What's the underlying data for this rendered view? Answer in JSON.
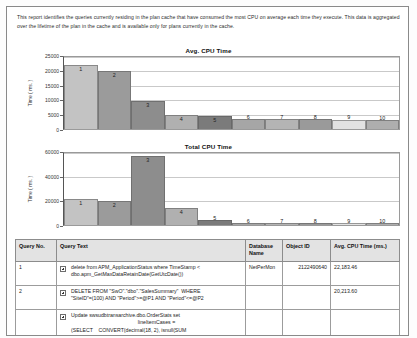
{
  "report": {
    "intro": "This report identifies the queries currently residing in the plan cache that have consumed the most CPU on average each time they execute.  This data is aggregated over the lifetime of the plan in the cache and is available only for plans currently in the cache."
  },
  "chart_data": [
    {
      "type": "bar",
      "title": "Avg. CPU Time",
      "xlabel": "",
      "ylabel": "Time ( ms. )",
      "categories": [
        "1",
        "2",
        "3",
        "4",
        "5",
        "6",
        "7",
        "8",
        "9",
        "10"
      ],
      "values": [
        22100,
        20200,
        9600,
        4900,
        4500,
        3400,
        3400,
        3350,
        3300,
        3250
      ],
      "ylim": [
        0,
        25000
      ],
      "yticks": [
        0,
        5000,
        10000,
        15000,
        20000,
        25000
      ],
      "grid": true,
      "legend": "none",
      "colors": [
        "#c3c3c3",
        "#9b9b9b",
        "#8d8d8d",
        "#b0b0b0",
        "#7b7b7b",
        "#a6a6a6",
        "#b4b4b4",
        "#9a9a9a",
        "#e2e2e2",
        "#aeaeae"
      ]
    },
    {
      "type": "bar",
      "title": "Total CPU Time",
      "xlabel": "",
      "ylabel": "Time ( ms. )",
      "categories": [
        "1",
        "2",
        "3",
        "4",
        "5",
        "6",
        "7",
        "8",
        "9",
        "10"
      ],
      "values": [
        21500,
        19800,
        57500,
        13800,
        4000,
        1600,
        1500,
        1700,
        1300,
        1400
      ],
      "ylim": [
        0,
        60000
      ],
      "yticks": [
        0,
        20000,
        40000,
        60000
      ],
      "grid": true,
      "legend": "none",
      "colors": [
        "#c3c3c3",
        "#9b9b9b",
        "#8d8d8d",
        "#b0b0b0",
        "#7b7b7b",
        "#a6a6a6",
        "#b4b4b4",
        "#9a9a9a",
        "#e2e2e2",
        "#aeaeae"
      ]
    }
  ],
  "table": {
    "headers": {
      "query_no": "Query No.",
      "query_text": "Query Text",
      "database_name": "Database Name",
      "object_id": "Object ID",
      "avg_cpu": "Avg. CPU Time (ms.)"
    },
    "rows": [
      {
        "no": "1",
        "text_lines": [
          "delete from APM_ApplicationStatus where TimeStamp <",
          "dbo.apm_GetMaxDataRetainDate(GetUtcDate())"
        ],
        "database_name": "NetPerMon",
        "object_id": "2122490640",
        "avg_cpu": "22,183.46"
      },
      {
        "no": "2",
        "text_lines": [
          "DELETE FROM \"SwO\".\"dbo\".\"SalesSummary\"  WHERE",
          "\"SiteID\"=(100) AND \"Period\">=@P1 AND \"Period\"<=@P2"
        ],
        "database_name": "",
        "object_id": "",
        "avg_cpu": "20,213.60"
      },
      {
        "no": "",
        "text_lines": [
          "Update swsudbtransarchive.dbo.OrderStats set",
          "lineItemCases =",
          "(SELECT    CONVERT(decimal(18, 2), isnull(SUM",
          "(li.CaseQuantity), 0))"
        ],
        "database_name": "",
        "object_id": "",
        "avg_cpu": ""
      }
    ]
  }
}
